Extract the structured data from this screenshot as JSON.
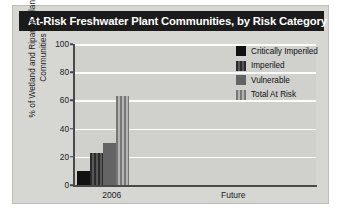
{
  "title": "At-Risk Freshwater Plant Communities, by Risk Category",
  "colors": {
    "title_bar_bg": "#1b1b1b",
    "title_text": "#ffffff",
    "card_bg": "#d6d6d3",
    "plot_bg": "#d0d0cd",
    "gridline": "#fdfdfc",
    "axis": "#4a4a4a",
    "critically_imperiled": "#111111",
    "imperiled": "#3a3a3a",
    "vulnerable": "#646464",
    "total_at_risk": "#9a9a9a"
  },
  "legend": {
    "items": [
      {
        "label": "Critically Imperiled",
        "swatch": "solid-black"
      },
      {
        "label": "Imperiled",
        "swatch": "stripe-dark"
      },
      {
        "label": "Vulnerable",
        "swatch": "solid-gray"
      },
      {
        "label": "Total At Risk",
        "swatch": "stripe-light"
      }
    ]
  },
  "chart_data": {
    "type": "bar",
    "title": "At-Risk Freshwater Plant Communities, by Risk Category",
    "xlabel": "",
    "ylabel": "% of Wetland and Riparian Plant Communities",
    "categories": [
      "2006",
      "Future"
    ],
    "ylim": [
      0,
      100
    ],
    "yticks": [
      0,
      20,
      40,
      60,
      80,
      100
    ],
    "ytick_labels": [
      "0",
      "20",
      "40",
      "60",
      "80",
      "100"
    ],
    "grid": true,
    "legend_position": "top-right inside plot",
    "series": [
      {
        "name": "Critically Imperiled",
        "values": [
          10,
          null
        ]
      },
      {
        "name": "Imperiled",
        "values": [
          23,
          null
        ]
      },
      {
        "name": "Vulnerable",
        "values": [
          30,
          null
        ]
      },
      {
        "name": "Total At Risk",
        "values": [
          63,
          null
        ]
      }
    ]
  }
}
